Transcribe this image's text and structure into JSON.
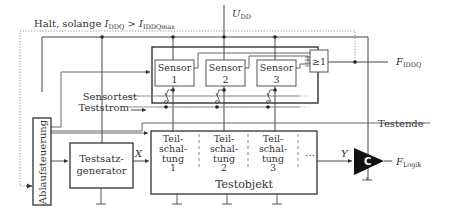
{
  "diagram": {
    "type": "block-diagram",
    "labels": {
      "halt_condition": "Halt, solange ",
      "halt_i": "I",
      "halt_i_sub": "DDQ",
      "halt_gt": " > ",
      "halt_imax": "I",
      "halt_imax_sub": "IDDQmax",
      "udd": "U",
      "udd_sub": "DD",
      "sensortest": "Sensortest",
      "teststrom": "Teststrom",
      "testende": "Testende",
      "x_signal": "X",
      "y_signal": "Y",
      "f_iddq": "F",
      "f_iddq_sub": "IDDQ",
      "f_logik": "F",
      "f_logik_sub": "Logik"
    },
    "blocks": {
      "ablaufsteuerung": "Ablaufsteuerung",
      "testsatz_line1": "Testsatz-",
      "testsatz_line2": "generator",
      "or_gate": "≥1",
      "comparator": "C",
      "testobjekt": "Testobjekt",
      "ellipsis": "…"
    },
    "sensors": [
      {
        "line1": "Sensor",
        "line2": "1"
      },
      {
        "line1": "Sensor",
        "line2": "2"
      },
      {
        "line1": "Sensor",
        "line2": "3"
      }
    ],
    "teilschaltungen": [
      {
        "l1": "Teil-",
        "l2": "schal-",
        "l3": "tung",
        "l4": "1"
      },
      {
        "l1": "Teil-",
        "l2": "schal-",
        "l3": "tung",
        "l4": "2"
      },
      {
        "l1": "Teil-",
        "l2": "schal-",
        "l3": "tung",
        "l4": "3"
      }
    ]
  }
}
